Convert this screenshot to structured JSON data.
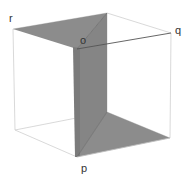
{
  "diagram": {
    "type": "cube-with-shaded-planes",
    "labels": {
      "r": "r",
      "o": "o",
      "q": "q",
      "p": "p"
    },
    "colors": {
      "edge": "#c8c8c8",
      "edge_dark": "#555555",
      "shade": "#8a8a8a",
      "shade_dark": "#7a7a7a",
      "background": "#ffffff"
    }
  }
}
